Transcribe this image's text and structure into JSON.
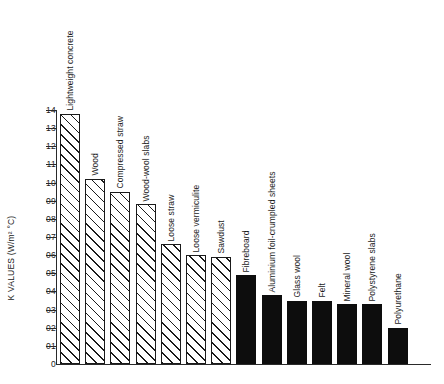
{
  "chart_data": {
    "type": "bar",
    "title": "",
    "xlabel": "",
    "ylabel": "K VALUES (W/m² °C)",
    "ylim": [
      0,
      1.4
    ],
    "grid": false,
    "legend": "none",
    "ytick_labels": [
      "0",
      "01",
      "02",
      "03",
      "04",
      "05",
      "06",
      "07",
      "08",
      "09",
      "10",
      "11",
      "12",
      "13",
      "14"
    ],
    "ytick_values": [
      0,
      0.1,
      0.2,
      0.3,
      0.4,
      0.5,
      0.6,
      0.7,
      0.8,
      0.9,
      1.0,
      1.1,
      1.2,
      1.3,
      1.4
    ],
    "categories": [
      "Lightweight concrete",
      "Wood",
      "Compressed straw",
      "Wood-wool slabs",
      "Loose straw",
      "Loose vermiculite",
      "Sawdust",
      "Fibreboard",
      "Aluminium foil-crumpled sheets",
      "Glass wool",
      "Felt",
      "Mineral wool",
      "Polystyrene slabs",
      "Polyurethane"
    ],
    "values": [
      1.38,
      1.02,
      0.95,
      0.88,
      0.66,
      0.6,
      0.59,
      0.49,
      0.38,
      0.35,
      0.35,
      0.33,
      0.33,
      0.2
    ],
    "bar_styles": [
      "hatched",
      "hatched",
      "hatched",
      "hatched",
      "hatched",
      "hatched",
      "hatched",
      "solid",
      "solid",
      "solid",
      "solid",
      "solid",
      "solid",
      "solid"
    ],
    "colors": {
      "axis": "#1a1a1a",
      "hatched_fill": "#ffffff",
      "hatched_line": "#1a1a1a",
      "solid_fill": "#0d0d0d",
      "background": "#ffffff"
    }
  }
}
